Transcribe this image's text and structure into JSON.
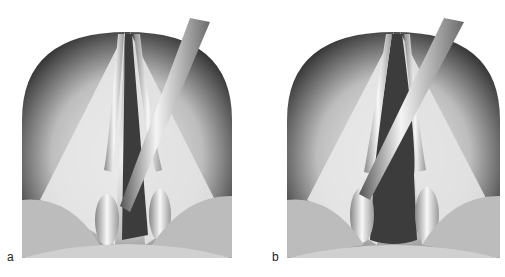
{
  "figure": {
    "panels": [
      {
        "label": "a",
        "subject": "laryngoscopic view of larynx with instrument inserted through glottis (narrow opening)"
      },
      {
        "label": "b",
        "subject": "laryngoscopic view of larynx with instrument, glottis widened"
      }
    ]
  },
  "colors": {
    "background": "#ffffff",
    "tissue_light": "#ececec",
    "tissue_dark": "#2a2a2a",
    "glottis": "#3c3c3c",
    "instrument": "#d8d8d8"
  }
}
